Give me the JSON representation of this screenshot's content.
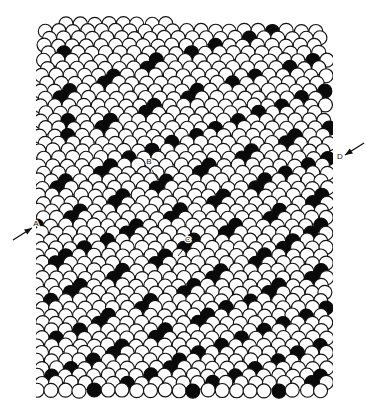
{
  "figure": {
    "width": 366,
    "height": 415,
    "background_color": "#ffffff"
  },
  "lattice": {
    "description": "Two-dimensional hexagonal close-packed raft of spheres. Open circles are normal lattice spheres; solid black circles trace the dislocation / grain-boundary lines.",
    "sphere_diameter_px": 14,
    "row_spacing_px": 13.1,
    "column_spacing_px": 14.2,
    "row_count": 30,
    "sphere_colors": {
      "open_fill": "#ffffff",
      "open_stroke": "#111111",
      "filled_fill": "#0a0a0a"
    },
    "origin": {
      "x": 45,
      "y": 24
    },
    "clip_region": {
      "left": 36,
      "right": 333,
      "top": 14,
      "bottom": 402
    },
    "rows": [
      {
        "y": 24.0,
        "x_start": 66.0,
        "count": 8,
        "marked": []
      },
      {
        "y": 31.0,
        "x_start": 45.0,
        "count": 20,
        "marked": [
          16
        ]
      },
      {
        "y": 38.0,
        "x_start": 50.0,
        "count": 20,
        "marked": [
          14
        ]
      },
      {
        "y": 45.5,
        "x_start": 44.0,
        "count": 20,
        "marked": [
          12
        ]
      },
      {
        "y": 53.0,
        "x_start": 49.0,
        "count": 20,
        "marked": [
          1,
          10
        ]
      },
      {
        "y": 60.5,
        "x_start": 43.0,
        "count": 21,
        "marked": [
          8,
          19
        ]
      },
      {
        "y": 68.0,
        "x_start": 48.0,
        "count": 20,
        "marked": [
          7,
          17
        ]
      },
      {
        "y": 75.5,
        "x_start": 42.0,
        "count": 21,
        "marked": [
          5,
          15
        ]
      },
      {
        "y": 83.0,
        "x_start": 47.0,
        "count": 20,
        "marked": [
          4,
          13
        ]
      },
      {
        "y": 90.5,
        "x_start": 41.0,
        "count": 21,
        "marked": [
          2,
          11,
          20
        ]
      },
      {
        "y": 98.0,
        "x_start": 46.0,
        "count": 20,
        "marked": [
          1,
          10,
          18
        ]
      },
      {
        "y": 105.5,
        "x_start": 41.0,
        "count": 21,
        "marked": [
          8,
          17
        ]
      },
      {
        "y": 113.0,
        "x_start": 46.0,
        "count": 20,
        "marked": [
          7,
          15
        ]
      },
      {
        "y": 120.5,
        "x_start": 40.0,
        "count": 21,
        "marked": [
          2,
          5,
          14
        ]
      },
      {
        "y": 128.0,
        "x_start": 45.0,
        "count": 21,
        "marked": [
          4,
          12,
          20
        ]
      },
      {
        "y": 135.5,
        "x_start": 40.0,
        "count": 21,
        "marked": [
          2,
          11,
          18
        ]
      },
      {
        "y": 143.0,
        "x_start": 45.0,
        "count": 21,
        "marked": [
          9,
          17
        ]
      },
      {
        "y": 150.5,
        "x_start": 39.0,
        "count": 21,
        "marked": [
          8,
          15
        ]
      },
      {
        "y": 158.0,
        "x_start": 44.0,
        "count": 21,
        "marked": [
          6,
          14,
          20
        ]
      },
      {
        "y": 165.5,
        "x_start": 39.0,
        "count": 21,
        "marked": [
          5,
          12,
          19
        ]
      },
      {
        "y": 173.0,
        "x_start": 44.0,
        "count": 21,
        "marked": [
          4,
          11,
          17
        ]
      },
      {
        "y": 180.5,
        "x_start": 38.0,
        "count": 21,
        "marked": [
          2,
          9,
          16
        ]
      },
      {
        "y": 188.0,
        "x_start": 43.0,
        "count": 21,
        "marked": [
          1,
          8,
          15
        ]
      },
      {
        "y": 195.5,
        "x_start": 38.0,
        "count": 21,
        "marked": [
          6,
          13,
          20
        ]
      },
      {
        "y": 203.0,
        "x_start": 43.0,
        "count": 21,
        "marked": [
          5,
          12,
          19
        ]
      },
      {
        "y": 210.5,
        "x_start": 38.0,
        "count": 21,
        "marked": [
          3,
          10,
          17
        ]
      },
      {
        "y": 218.0,
        "x_start": 43.0,
        "count": 21,
        "marked": [
          2,
          9,
          16
        ]
      },
      {
        "y": 225.5,
        "x_start": 37.0,
        "count": 21,
        "marked": [
          0,
          7,
          14,
          20
        ]
      },
      {
        "y": 233.0,
        "x_start": 42.0,
        "count": 21,
        "marked": [
          6,
          13,
          19
        ]
      },
      {
        "y": 240.5,
        "x_start": 37.0,
        "count": 21,
        "marked": [
          5,
          11,
          18
        ]
      },
      {
        "y": 248.0,
        "x_start": 42.0,
        "count": 21,
        "marked": [
          3,
          10,
          17
        ]
      },
      {
        "y": 255.5,
        "x_start": 37.0,
        "count": 21,
        "marked": [
          2,
          9,
          16
        ]
      },
      {
        "y": 263.0,
        "x_start": 42.0,
        "count": 21,
        "marked": [
          1,
          8,
          15
        ]
      },
      {
        "y": 270.5,
        "x_start": 37.0,
        "count": 21,
        "marked": [
          6,
          13,
          20
        ]
      },
      {
        "y": 278.0,
        "x_start": 42.0,
        "count": 21,
        "marked": [
          5,
          12,
          19
        ]
      },
      {
        "y": 285.5,
        "x_start": 37.0,
        "count": 21,
        "marked": [
          3,
          11,
          17
        ]
      },
      {
        "y": 293.0,
        "x_start": 42.0,
        "count": 21,
        "marked": [
          2,
          10,
          16
        ]
      },
      {
        "y": 300.5,
        "x_start": 37.0,
        "count": 21,
        "marked": [
          1,
          8,
          15
        ]
      },
      {
        "y": 308.0,
        "x_start": 42.0,
        "count": 21,
        "marked": [
          7,
          13,
          20
        ]
      },
      {
        "y": 315.5,
        "x_start": 37.0,
        "count": 21,
        "marked": [
          5,
          12,
          19
        ]
      },
      {
        "y": 323.0,
        "x_start": 42.0,
        "count": 21,
        "marked": [
          4,
          11,
          17
        ]
      },
      {
        "y": 330.5,
        "x_start": 37.0,
        "count": 21,
        "marked": [
          3,
          9,
          16
        ]
      },
      {
        "y": 338.0,
        "x_start": 42.0,
        "count": 21,
        "marked": [
          1,
          8,
          14
        ]
      },
      {
        "y": 345.5,
        "x_start": 37.0,
        "count": 21,
        "marked": [
          6,
          13,
          20
        ]
      },
      {
        "y": 353.0,
        "x_start": 42.0,
        "count": 21,
        "marked": [
          5,
          11,
          18
        ]
      },
      {
        "y": 360.5,
        "x_start": 37.0,
        "count": 21,
        "marked": [
          4,
          10,
          17
        ]
      },
      {
        "y": 368.0,
        "x_start": 42.0,
        "count": 21,
        "marked": [
          2,
          9,
          15
        ]
      },
      {
        "y": 375.5,
        "x_start": 37.0,
        "count": 21,
        "marked": [
          1,
          8,
          14,
          20
        ]
      },
      {
        "y": 383.0,
        "x_start": 42.0,
        "count": 21,
        "marked": [
          6,
          12,
          19
        ]
      },
      {
        "y": 390.5,
        "x_start": 37.0,
        "count": 21,
        "marked": [
          4,
          11,
          17
        ]
      }
    ]
  },
  "annotations": {
    "labels": [
      {
        "id": "label-a",
        "text": "A",
        "x": 36,
        "y": 226
      },
      {
        "id": "label-b",
        "text": "B",
        "x": 149,
        "y": 164
      },
      {
        "id": "label-c",
        "text": "C",
        "x": 188,
        "y": 242
      },
      {
        "id": "label-d",
        "text": "D",
        "x": 340,
        "y": 159
      }
    ],
    "arrows": [
      {
        "id": "arrow-left",
        "points_to": "A",
        "tail": {
          "x": 13,
          "y": 240
        },
        "head": {
          "x": 32,
          "y": 228
        }
      },
      {
        "id": "arrow-right",
        "points_to": "D",
        "tail": {
          "x": 364,
          "y": 143
        },
        "head": {
          "x": 345,
          "y": 155
        }
      }
    ],
    "leaders": [
      {
        "id": "leader-b",
        "from": {
          "x": 152,
          "y": 170
        },
        "to": {
          "x": 158,
          "y": 180
        }
      },
      {
        "id": "leader-c",
        "from": {
          "x": 185,
          "y": 247
        },
        "to": {
          "x": 178,
          "y": 256
        }
      }
    ]
  }
}
